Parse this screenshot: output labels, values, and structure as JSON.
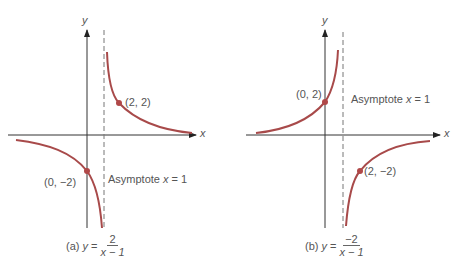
{
  "colors": {
    "curve": "#a84a4a",
    "axis": "#333333",
    "asymptote": "#777777",
    "dot": "#b04848",
    "text": "#555555"
  },
  "panels": [
    {
      "id": "a",
      "y_axis_label": "y",
      "x_axis_label": "x",
      "points": [
        {
          "label": "(2, 2)",
          "x": 2,
          "y": 2
        },
        {
          "label": "(0, −2)",
          "x": 0,
          "y": -2
        }
      ],
      "asymptote_label": "Asymptote ",
      "asymptote_var": "x",
      "asymptote_eq": " = 1",
      "caption_prefix": "(a) ",
      "caption_y": "y",
      "caption_eq": " = ",
      "caption_num": "2",
      "caption_den": "x − 1"
    },
    {
      "id": "b",
      "y_axis_label": "y",
      "x_axis_label": "x",
      "points": [
        {
          "label": "(0, 2)",
          "x": 0,
          "y": 2
        },
        {
          "label": "(2, −2)",
          "x": 2,
          "y": -2
        }
      ],
      "asymptote_label": "Asymptote ",
      "asymptote_var": "x",
      "asymptote_eq": " = 1",
      "caption_prefix": "(b) ",
      "caption_y": "y",
      "caption_eq": " = ",
      "caption_num": "−2",
      "caption_den": "x − 1"
    }
  ]
}
